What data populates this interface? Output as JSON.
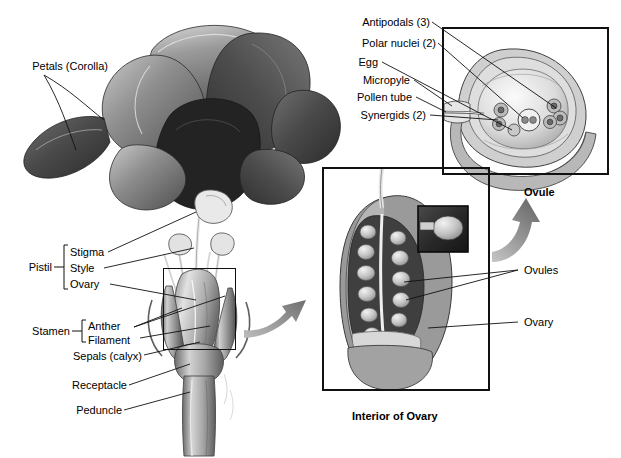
{
  "figure": {
    "type": "botanical-diagram"
  },
  "flower_labels": [
    {
      "id": "petals",
      "text": "Petals (Corolla)"
    },
    {
      "id": "stigma",
      "text": "Stigma"
    },
    {
      "id": "style",
      "text": "Style"
    },
    {
      "id": "ovary",
      "text": "Ovary"
    },
    {
      "id": "pistil",
      "text": "Pistil"
    },
    {
      "id": "anther",
      "text": "Anther"
    },
    {
      "id": "filament",
      "text": "Filament"
    },
    {
      "id": "stamen",
      "text": "Stamen"
    },
    {
      "id": "sepals",
      "text": "Sepals (calyx)"
    },
    {
      "id": "receptacle",
      "text": "Receptacle"
    },
    {
      "id": "peduncle",
      "text": "Peduncle"
    }
  ],
  "ovule_labels": [
    {
      "id": "antipodals",
      "text": "Antipodals (3)"
    },
    {
      "id": "polar-nuclei",
      "text": "Polar nuclei (2)"
    },
    {
      "id": "egg",
      "text": "Egg"
    },
    {
      "id": "micropyle",
      "text": "Micropyle"
    },
    {
      "id": "pollen-tube",
      "text": "Pollen tube"
    },
    {
      "id": "synergids",
      "text": "Synergids (2)"
    }
  ],
  "ovary_inset_labels": [
    {
      "id": "ovules",
      "text": "Ovules"
    },
    {
      "id": "ovary-inset",
      "text": "Ovary"
    }
  ],
  "captions": {
    "ovule": "Ovule",
    "interior_of_ovary": "Interior of Ovary"
  },
  "colors": {
    "ink": "#111111",
    "arrow": "#8d8d8d",
    "background": "#ffffff"
  }
}
